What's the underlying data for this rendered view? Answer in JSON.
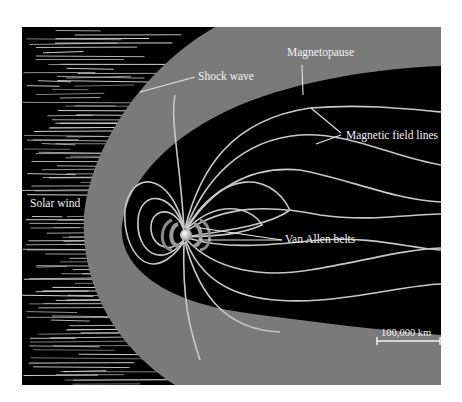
{
  "diagram": {
    "labels": {
      "shock_wave": "Shock wave",
      "magnetopause": "Magnetopause",
      "magnetic_field_lines": "Magnetic field lines",
      "solar_wind": "Solar wind",
      "van_allen_belts": "Van Allen belts"
    },
    "scale_bar": {
      "label": "100,000 km"
    },
    "colors": {
      "space": "#000000",
      "magnetosheath": "#7a7a7a",
      "magnetosphere": "#000000",
      "field_lines": "#c8c8c8",
      "text": "#f2f2f2",
      "background": "#ffffff"
    }
  }
}
